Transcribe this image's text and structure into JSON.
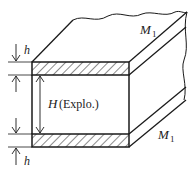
{
  "diagram": {
    "type": "layered explosive slab schematic",
    "labels": {
      "h_top": "h",
      "h_bottom": "h",
      "H_symbol": "H",
      "H_desc": "(Explo.)",
      "M1_top_sym": "M",
      "M1_top_sub": "1",
      "M1_bottom_sym": "M",
      "M1_bottom_sub": "1"
    },
    "colors": {
      "stroke": "#1a1a1a",
      "background": "#ffffff"
    }
  }
}
